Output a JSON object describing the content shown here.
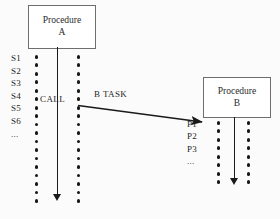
{
  "diagram": {
    "procedure_a": {
      "line1": "Procedure",
      "line2": "A",
      "step_labels": [
        "S1",
        "S2",
        "S3",
        "S4",
        "S5",
        "S6",
        "..."
      ],
      "dot_count_per_column": 18
    },
    "procedure_b": {
      "line1": "Procedure",
      "line2": "B",
      "step_labels": [
        "P1",
        "P2",
        "P3",
        "..."
      ],
      "dot_count_per_column": 8
    },
    "annotations": {
      "call_label": "CALL",
      "task_label": "B TASK"
    },
    "colors": {
      "ink": "#1a1a1a",
      "box_border": "#6e6e6e",
      "background": "#fbfbfb"
    }
  }
}
